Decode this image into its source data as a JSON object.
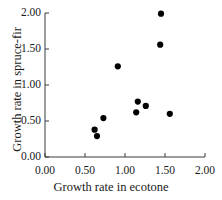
{
  "chart_data": {
    "type": "scatter",
    "title": "",
    "xlabel": "Growth rate in ecotone",
    "ylabel": "Growth rate in spruce-fir",
    "xlim": [
      0.0,
      2.0
    ],
    "ylim": [
      0.0,
      2.0
    ],
    "grid": false,
    "legend": null,
    "xticks": [
      "0.00",
      "0.50",
      "1.00",
      "1.50",
      "2.00"
    ],
    "xtick_values": [
      0.0,
      0.5,
      1.0,
      1.5,
      2.0
    ],
    "yticks": [
      "0.00",
      "0.50",
      "1.00",
      "1.50",
      "2.00"
    ],
    "ytick_values": [
      0.0,
      0.5,
      1.0,
      1.5,
      2.0
    ],
    "marker": {
      "shape": "circle",
      "color": "#000000",
      "size": 5
    },
    "axis_color": "#3a3a3a",
    "points": [
      {
        "x": 1.45,
        "y": 1.99
      },
      {
        "x": 1.44,
        "y": 1.56
      },
      {
        "x": 0.91,
        "y": 1.26
      },
      {
        "x": 1.16,
        "y": 0.77
      },
      {
        "x": 1.26,
        "y": 0.71
      },
      {
        "x": 1.14,
        "y": 0.62
      },
      {
        "x": 1.56,
        "y": 0.6
      },
      {
        "x": 0.73,
        "y": 0.54
      },
      {
        "x": 0.62,
        "y": 0.38
      },
      {
        "x": 0.65,
        "y": 0.29
      }
    ]
  }
}
